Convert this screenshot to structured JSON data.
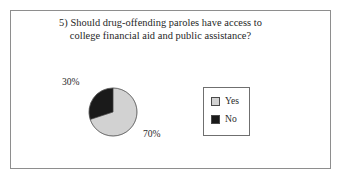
{
  "figure": {
    "frame_border_color": "#8e8e8e",
    "background": "#ffffff"
  },
  "title": {
    "line1": "5) Should drug-offending paroles have access to",
    "line2": "college financial aid and public assistance?"
  },
  "labels": {
    "yes_pct": "70%",
    "no_pct": "30%"
  },
  "legend": {
    "items": [
      {
        "label": "Yes",
        "color": "#d2d2d2"
      },
      {
        "label": "No",
        "color": "#1a1a1a"
      }
    ]
  },
  "chart_data": {
    "type": "pie",
    "title": "5) Should drug-offending paroles have access to college financial aid and public assistance?",
    "categories": [
      "Yes",
      "No"
    ],
    "values": [
      70,
      30
    ],
    "value_labels": [
      "70%",
      "30%"
    ],
    "colors": [
      "#d2d2d2",
      "#1a1a1a"
    ],
    "units": "percent",
    "start_angle_deg": 0,
    "direction": "counterclockwise",
    "legend_position": "right",
    "grid": false,
    "xlabel": "",
    "ylabel": ""
  }
}
